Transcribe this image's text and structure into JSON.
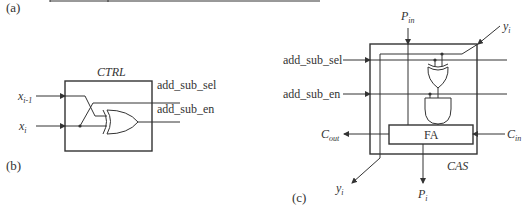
{
  "panels": {
    "a": {
      "label": "(a)"
    },
    "b": {
      "label": "(b)",
      "block_title": "CTRL",
      "inputs": [
        {
          "name": "x",
          "sub": "i-1"
        },
        {
          "name": "x",
          "sub": "i"
        }
      ],
      "outputs": [
        "add_sub_sel",
        "add_sub_en"
      ],
      "gates": [
        "XOR"
      ]
    },
    "c": {
      "label": "(c)",
      "block_title": "CAS",
      "inputs": {
        "add_sub_sel": "add_sub_sel",
        "add_sub_en": "add_sub_en",
        "p_in": {
          "name": "P",
          "sub": "in"
        },
        "y_in": {
          "name": "y",
          "sub": "i"
        },
        "c_in": {
          "name": "C",
          "sub": "in"
        }
      },
      "outputs": {
        "c_out": {
          "name": "C",
          "sub": "out"
        },
        "p_out": {
          "name": "P",
          "sub": "i"
        },
        "y_out": {
          "name": "y",
          "sub": "i"
        }
      },
      "inner_block": "FA",
      "gates": [
        "XOR",
        "AND"
      ]
    }
  }
}
